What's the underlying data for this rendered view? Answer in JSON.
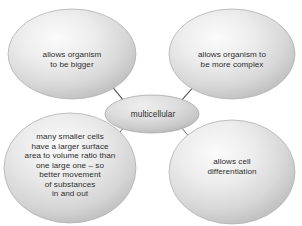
{
  "diagram": {
    "type": "concept-map",
    "background_color": "#ffffff",
    "bubble_fill_light": "#f2f2f2",
    "bubble_fill_mid": "#dcdcdc",
    "bubble_fill_edge": "#bdbdbd",
    "bubble_edge_color": "#b3b3b3",
    "connector_color": "#3a3a3a",
    "text_color": "#2c2c2c",
    "center": {
      "id": "center-node",
      "label": "multicellular",
      "shape": "ellipse",
      "cx": 152,
      "cy": 114,
      "rx": 47,
      "ry": 19
    },
    "nodes": [
      {
        "id": "node-top-left",
        "label": "allows organism\nto be bigger",
        "shape": "ellipse",
        "cx": 72,
        "cy": 54,
        "rx": 64,
        "ry": 45
      },
      {
        "id": "node-top-right",
        "label": "allows organism to\nbe more complex",
        "shape": "ellipse",
        "cx": 232,
        "cy": 54,
        "rx": 63,
        "ry": 45
      },
      {
        "id": "node-bottom-left",
        "label": "many smaller cells\nhave a larger surface\narea to volume ratio than\none large one – so\nbetter movement\nof substances\nin and out",
        "shape": "ellipse",
        "cx": 70,
        "cy": 168,
        "rx": 66,
        "ry": 55
      },
      {
        "id": "node-bottom-right",
        "label": "allows cell\ndifferentiation",
        "shape": "ellipse",
        "cx": 232,
        "cy": 172,
        "rx": 63,
        "ry": 52
      }
    ],
    "connectors": [
      {
        "id": "connector-top-left",
        "from": "center-node",
        "to": "node-top-left",
        "x1": 124,
        "y1": 101,
        "x2": 110,
        "y2": 84
      },
      {
        "id": "connector-top-right",
        "from": "center-node",
        "to": "node-top-right",
        "x1": 181,
        "y1": 101,
        "x2": 196,
        "y2": 84
      },
      {
        "id": "connector-bottom-left",
        "from": "center-node",
        "to": "node-bottom-left",
        "x1": 124,
        "y1": 127,
        "x2": 110,
        "y2": 145
      },
      {
        "id": "connector-bottom-right",
        "from": "center-node",
        "to": "node-bottom-right",
        "x1": 181,
        "y1": 127,
        "x2": 196,
        "y2": 145
      }
    ]
  }
}
